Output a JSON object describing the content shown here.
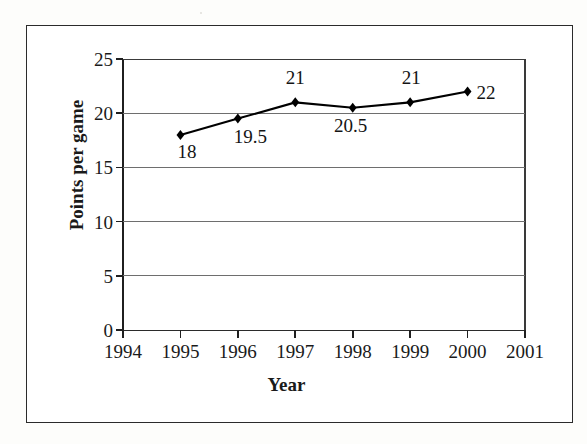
{
  "chart_data": {
    "type": "line",
    "title": "",
    "xlabel": "Year",
    "ylabel": "Points per game",
    "x": [
      1995,
      1996,
      1997,
      1998,
      1999,
      2000
    ],
    "values": [
      18,
      19.5,
      21,
      20.5,
      21,
      22
    ],
    "point_labels": [
      "18",
      "19.5",
      "21",
      "20.5",
      "21",
      "22"
    ],
    "xticks": [
      "1994",
      "1995",
      "1996",
      "1997",
      "1998",
      "1999",
      "2000",
      "2001"
    ],
    "xlim": [
      1994,
      2001
    ],
    "yticks": [
      "0",
      "5",
      "10",
      "15",
      "20",
      "25"
    ],
    "ylim": [
      0,
      25
    ],
    "grid": "horizontal",
    "legend": "none",
    "marker": "diamond",
    "series_color": "#000000",
    "grid_color": "#6e6e6e",
    "axis_color": "#1f1f1f"
  }
}
